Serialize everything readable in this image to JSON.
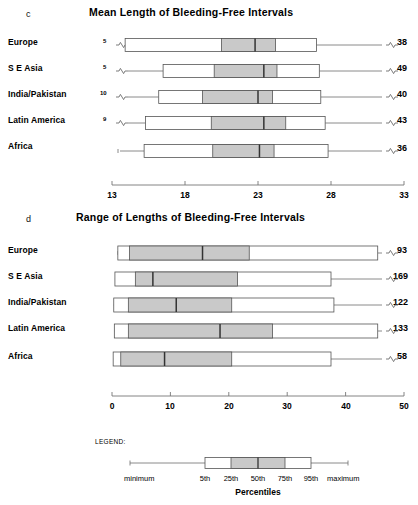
{
  "figure": {
    "panels": [
      {
        "letter": "c",
        "title": "Mean Length of Bleeding-Free Intervals",
        "axis": {
          "min": 13,
          "max": 33,
          "ticks": [
            13,
            18,
            23,
            28,
            33
          ]
        },
        "rows": [
          {
            "label": "Europe",
            "min_label": "5",
            "max_label": "38",
            "p5": 13.9,
            "p25": 20.5,
            "p50": 22.8,
            "p75": 24.2,
            "p95": 27.0
          },
          {
            "label": "S E Asia",
            "min_label": "5",
            "max_label": "49",
            "p5": 16.5,
            "p25": 20.0,
            "p50": 23.4,
            "p75": 24.3,
            "p95": 27.2
          },
          {
            "label": "India/Pakistan",
            "min_label": "10",
            "max_label": "40",
            "p5": 16.2,
            "p25": 19.2,
            "p50": 23.0,
            "p75": 24.0,
            "p95": 27.3
          },
          {
            "label": "Latin America",
            "min_label": "9",
            "max_label": "43",
            "p5": 15.3,
            "p25": 19.8,
            "p50": 23.4,
            "p75": 24.9,
            "p95": 27.6
          },
          {
            "label": "Africa",
            "min_label": "",
            "max_label": "36",
            "p5": 15.2,
            "p25": 19.9,
            "p50": 23.1,
            "p75": 24.1,
            "p95": 27.8
          }
        ]
      },
      {
        "letter": "d",
        "title": "Range of Lengths of Bleeding-Free Intervals",
        "axis": {
          "min": 0,
          "max": 50,
          "ticks": [
            0,
            10,
            20,
            30,
            40,
            50
          ]
        },
        "rows": [
          {
            "label": "Europe",
            "min_label": "",
            "max_label": "93",
            "p5": 1.0,
            "p25": 3.0,
            "p50": 15.5,
            "p75": 23.5,
            "p95": 45.5
          },
          {
            "label": "S E Asia",
            "min_label": "",
            "max_label": "169",
            "p5": 0.5,
            "p25": 4.0,
            "p50": 7.0,
            "p75": 21.5,
            "p95": 37.5
          },
          {
            "label": "India/Pakistan",
            "min_label": "",
            "max_label": "122",
            "p5": 0.3,
            "p25": 2.8,
            "p50": 11.0,
            "p75": 20.5,
            "p95": 38.0
          },
          {
            "label": "Latin America",
            "min_label": "",
            "max_label": "133",
            "p5": 0.4,
            "p25": 2.8,
            "p50": 18.5,
            "p75": 27.5,
            "p95": 45.5
          },
          {
            "label": "Africa",
            "min_label": "",
            "max_label": "58",
            "p5": 0.2,
            "p25": 1.5,
            "p50": 9.0,
            "p75": 20.5,
            "p95": 37.5
          }
        ]
      }
    ],
    "legend": {
      "title": "LEGEND:",
      "minimum": "minimum",
      "maximum": "maximum",
      "percentiles_axis": "Percentiles",
      "percentile_labels": [
        "5th",
        "25th",
        "50th",
        "75th",
        "95th"
      ]
    },
    "colors": {
      "box_fill": "#c9c9c9",
      "box_stroke": "#555555",
      "line": "#6d6d6d",
      "text": "#000000"
    }
  },
  "chart_data": {
    "type": "box",
    "panels": [
      {
        "id": "c",
        "title": "Mean Length of Bleeding-Free Intervals",
        "xlabel": "",
        "xlim": [
          13,
          33
        ],
        "xticks": [
          13,
          18,
          23,
          28,
          33
        ],
        "grid": false,
        "categories": [
          "Europe",
          "S E Asia",
          "India/Pakistan",
          "Latin America",
          "Africa"
        ],
        "series": [
          {
            "name": "Europe",
            "minimum": 5,
            "p5": 13.9,
            "p25": 20.5,
            "p50": 22.8,
            "p75": 24.2,
            "p95": 27.0,
            "maximum": 38
          },
          {
            "name": "S E Asia",
            "minimum": 5,
            "p5": 16.5,
            "p25": 20.0,
            "p50": 23.4,
            "p75": 24.3,
            "p95": 27.2,
            "maximum": 49
          },
          {
            "name": "India/Pakistan",
            "minimum": 10,
            "p5": 16.2,
            "p25": 19.2,
            "p50": 23.0,
            "p75": 24.0,
            "p95": 27.3,
            "maximum": 40
          },
          {
            "name": "Latin America",
            "minimum": 9,
            "p5": 15.3,
            "p25": 19.8,
            "p50": 23.4,
            "p75": 24.9,
            "p95": 27.6,
            "maximum": 43
          },
          {
            "name": "Africa",
            "minimum": null,
            "p5": 15.2,
            "p25": 19.9,
            "p50": 23.1,
            "p75": 24.1,
            "p95": 27.8,
            "maximum": 36
          }
        ]
      },
      {
        "id": "d",
        "title": "Range of Lengths of Bleeding-Free Intervals",
        "xlabel": "",
        "xlim": [
          0,
          50
        ],
        "xticks": [
          0,
          10,
          20,
          30,
          40,
          50
        ],
        "grid": false,
        "categories": [
          "Europe",
          "S E Asia",
          "India/Pakistan",
          "Latin America",
          "Africa"
        ],
        "series": [
          {
            "name": "Europe",
            "p5": 1.0,
            "p25": 3.0,
            "p50": 15.5,
            "p75": 23.5,
            "p95": 45.5,
            "maximum": 93
          },
          {
            "name": "S E Asia",
            "p5": 0.5,
            "p25": 4.0,
            "p50": 7.0,
            "p75": 21.5,
            "p95": 37.5,
            "maximum": 169
          },
          {
            "name": "India/Pakistan",
            "p5": 0.3,
            "p25": 2.8,
            "p50": 11.0,
            "p75": 20.5,
            "p95": 38.0,
            "maximum": 122
          },
          {
            "name": "Latin America",
            "p5": 0.4,
            "p25": 2.8,
            "p50": 18.5,
            "p75": 27.5,
            "p95": 45.5,
            "maximum": 133
          },
          {
            "name": "Africa",
            "p5": 0.2,
            "p25": 1.5,
            "p50": 9.0,
            "p75": 20.5,
            "p95": 37.5,
            "maximum": 58
          }
        ]
      }
    ],
    "legend": {
      "position": "bottom",
      "entries": [
        "minimum",
        "5th",
        "25th",
        "50th",
        "75th",
        "95th",
        "maximum"
      ],
      "axis_title": "Percentiles"
    }
  }
}
